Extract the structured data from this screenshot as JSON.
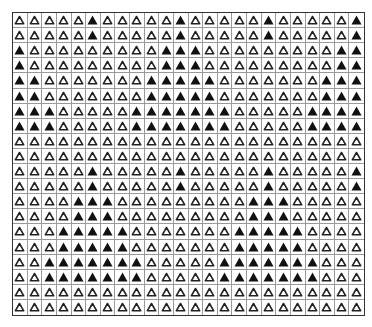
{
  "grid": {
    "rows": 20,
    "cols": 24,
    "symbol": "triangle",
    "colors": {
      "filled": "#111111",
      "outline": "#222222",
      "line": "#9a9a9a",
      "border": "#333333"
    },
    "legend": {
      "1": "filled-triangle",
      "0": "outlined-triangle"
    },
    "cells": [
      [
        0,
        0,
        0,
        0,
        0,
        1,
        0,
        0,
        0,
        0,
        0,
        1,
        0,
        0,
        0,
        0,
        0,
        1,
        0,
        0,
        0,
        0,
        0,
        1
      ],
      [
        0,
        0,
        0,
        0,
        0,
        1,
        0,
        0,
        0,
        0,
        0,
        1,
        0,
        0,
        0,
        0,
        0,
        1,
        0,
        0,
        0,
        0,
        0,
        1
      ],
      [
        1,
        0,
        0,
        0,
        0,
        0,
        0,
        0,
        0,
        0,
        1,
        1,
        1,
        0,
        0,
        0,
        0,
        0,
        0,
        0,
        0,
        0,
        1,
        1
      ],
      [
        1,
        0,
        0,
        0,
        0,
        0,
        0,
        0,
        0,
        0,
        1,
        1,
        1,
        0,
        0,
        0,
        0,
        0,
        0,
        0,
        0,
        0,
        1,
        1
      ],
      [
        1,
        1,
        0,
        0,
        0,
        0,
        0,
        0,
        0,
        1,
        1,
        1,
        1,
        1,
        0,
        0,
        0,
        0,
        0,
        0,
        0,
        1,
        1,
        1
      ],
      [
        1,
        1,
        0,
        0,
        0,
        0,
        0,
        0,
        0,
        1,
        1,
        1,
        1,
        1,
        0,
        0,
        0,
        0,
        0,
        0,
        0,
        1,
        1,
        1
      ],
      [
        1,
        1,
        1,
        0,
        0,
        0,
        0,
        0,
        1,
        1,
        1,
        1,
        1,
        1,
        1,
        0,
        0,
        0,
        0,
        0,
        1,
        1,
        1,
        1
      ],
      [
        1,
        1,
        1,
        0,
        0,
        0,
        0,
        0,
        1,
        1,
        1,
        1,
        1,
        1,
        1,
        0,
        0,
        0,
        0,
        0,
        1,
        1,
        1,
        1
      ],
      [
        0,
        0,
        0,
        0,
        0,
        0,
        0,
        0,
        0,
        0,
        0,
        0,
        0,
        0,
        0,
        0,
        0,
        0,
        0,
        0,
        0,
        0,
        0,
        0
      ],
      [
        0,
        0,
        0,
        0,
        0,
        0,
        0,
        0,
        0,
        0,
        0,
        0,
        0,
        0,
        0,
        0,
        0,
        0,
        0,
        0,
        0,
        0,
        0,
        0
      ],
      [
        0,
        0,
        0,
        0,
        0,
        1,
        0,
        0,
        0,
        0,
        0,
        1,
        0,
        0,
        0,
        0,
        0,
        1,
        0,
        0,
        0,
        0,
        0,
        1
      ],
      [
        0,
        0,
        0,
        0,
        0,
        1,
        0,
        0,
        0,
        0,
        0,
        1,
        0,
        0,
        0,
        0,
        0,
        1,
        0,
        0,
        0,
        0,
        0,
        1
      ],
      [
        0,
        0,
        0,
        0,
        1,
        1,
        1,
        0,
        0,
        0,
        0,
        0,
        0,
        0,
        0,
        0,
        1,
        1,
        1,
        0,
        0,
        0,
        0,
        0
      ],
      [
        0,
        0,
        0,
        0,
        1,
        1,
        1,
        0,
        0,
        0,
        0,
        0,
        0,
        0,
        0,
        0,
        1,
        1,
        1,
        0,
        0,
        0,
        0,
        0
      ],
      [
        0,
        0,
        0,
        1,
        1,
        1,
        1,
        1,
        0,
        0,
        0,
        0,
        0,
        0,
        0,
        1,
        1,
        1,
        1,
        1,
        0,
        0,
        0,
        0
      ],
      [
        0,
        0,
        0,
        1,
        1,
        1,
        1,
        1,
        0,
        0,
        0,
        0,
        0,
        0,
        0,
        1,
        1,
        1,
        1,
        1,
        0,
        0,
        0,
        0
      ],
      [
        0,
        0,
        1,
        1,
        1,
        1,
        1,
        1,
        1,
        0,
        0,
        0,
        0,
        0,
        1,
        1,
        1,
        1,
        1,
        1,
        1,
        0,
        0,
        0
      ],
      [
        0,
        0,
        1,
        1,
        1,
        1,
        1,
        1,
        1,
        0,
        0,
        0,
        0,
        0,
        1,
        1,
        1,
        1,
        1,
        1,
        1,
        0,
        0,
        0
      ],
      [
        0,
        0,
        0,
        0,
        0,
        0,
        0,
        0,
        0,
        0,
        0,
        0,
        0,
        0,
        0,
        0,
        0,
        0,
        0,
        0,
        0,
        0,
        0,
        0
      ],
      [
        0,
        0,
        0,
        0,
        0,
        0,
        0,
        0,
        0,
        0,
        0,
        0,
        0,
        0,
        0,
        0,
        0,
        0,
        0,
        0,
        0,
        0,
        0,
        0
      ]
    ]
  }
}
